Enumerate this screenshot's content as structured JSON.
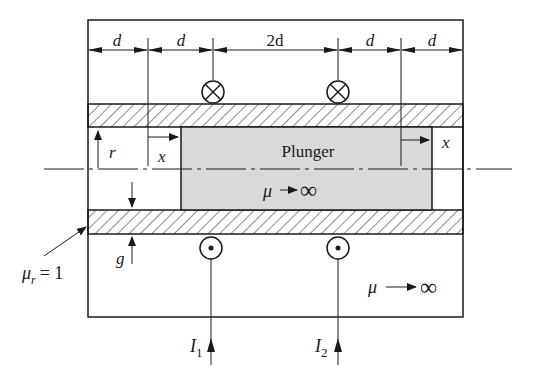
{
  "diagram": {
    "dimensions": [
      {
        "label": "d"
      },
      {
        "label": "d"
      },
      {
        "label": "2d"
      },
      {
        "label": "d"
      },
      {
        "label": "d"
      }
    ],
    "labels": {
      "plunger": "Plunger",
      "plunger_mu": "μ",
      "infinity": "∞",
      "core_mu": "μ",
      "mu_r": "μ",
      "mu_r_sub": "r",
      "mu_r_eq": "= 1",
      "radius": "r",
      "gap": "g",
      "x_left": "x",
      "x_right": "x",
      "current1": "I",
      "current1_sub": "1",
      "current2": "I",
      "current2_sub": "2"
    },
    "colors": {
      "line": "#1a1a1a",
      "plunger_fill": "#d9d9d9",
      "background": "#ffffff"
    }
  }
}
